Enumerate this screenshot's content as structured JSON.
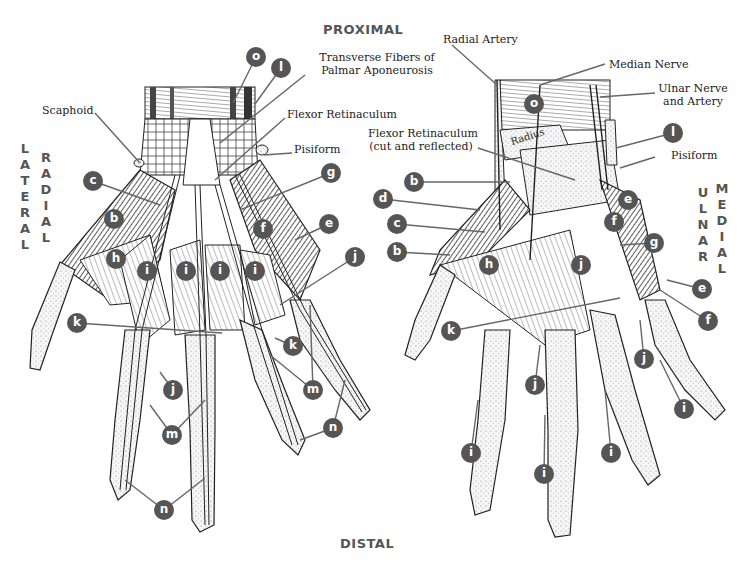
{
  "orientation": {
    "top": "PROXIMAL",
    "bottom": "DISTAL",
    "left_outer": "LATERAL",
    "left_inner": "RADIAL",
    "right_inner": "ULNAR",
    "right_outer": "MEDIAL"
  },
  "colors": {
    "badge": "#555555",
    "badge_text": "#ffffff",
    "leader": "#666666",
    "orientation_text": "#555555",
    "muscle_dark": "#3a3a3a",
    "bone": "#f4f4f4"
  },
  "left_view": {
    "text_labels": [
      {
        "id": "scaphoid",
        "text": "Scaphoid"
      },
      {
        "id": "transverse_fibers",
        "line1": "Transverse Fibers of",
        "line2": "Palmar Aponeurosis"
      },
      {
        "id": "flexor_retinaculum",
        "text": "Flexor Retinaculum"
      },
      {
        "id": "pisiform",
        "text": "Pisiform"
      }
    ],
    "badges": [
      {
        "letter": "o",
        "x": 256,
        "y": 57
      },
      {
        "letter": "l",
        "x": 281,
        "y": 68
      },
      {
        "letter": "c",
        "x": 93,
        "y": 181
      },
      {
        "letter": "g",
        "x": 331,
        "y": 173
      },
      {
        "letter": "b",
        "x": 114,
        "y": 219
      },
      {
        "letter": "e",
        "x": 329,
        "y": 224
      },
      {
        "letter": "f",
        "x": 263,
        "y": 229
      },
      {
        "letter": "h",
        "x": 116,
        "y": 259
      },
      {
        "letter": "i",
        "x": 147,
        "y": 271
      },
      {
        "letter": "i",
        "x": 186,
        "y": 271
      },
      {
        "letter": "i",
        "x": 220,
        "y": 271
      },
      {
        "letter": "i",
        "x": 255,
        "y": 271
      },
      {
        "letter": "j",
        "x": 355,
        "y": 257
      },
      {
        "letter": "k",
        "x": 77,
        "y": 323
      },
      {
        "letter": "k",
        "x": 293,
        "y": 346
      },
      {
        "letter": "j",
        "x": 173,
        "y": 390
      },
      {
        "letter": "m",
        "x": 313,
        "y": 390
      },
      {
        "letter": "m",
        "x": 172,
        "y": 435
      },
      {
        "letter": "n",
        "x": 333,
        "y": 428
      },
      {
        "letter": "n",
        "x": 164,
        "y": 510
      }
    ]
  },
  "right_view": {
    "text_labels": [
      {
        "id": "radial_artery",
        "text": "Radial Artery"
      },
      {
        "id": "median_nerve",
        "text": "Median Nerve"
      },
      {
        "id": "ulnar_nerve_artery",
        "line1": "Ulnar Nerve",
        "line2": "and Artery"
      },
      {
        "id": "flexor_retinaculum_cut",
        "line1": "Flexor Retinaculum",
        "line2": "(cut and reflected)"
      },
      {
        "id": "pisiform",
        "text": "Pisiform"
      },
      {
        "id": "radius",
        "text": "Radius"
      }
    ],
    "badges": [
      {
        "letter": "o",
        "x": 534,
        "y": 104
      },
      {
        "letter": "l",
        "x": 673,
        "y": 133
      },
      {
        "letter": "b",
        "x": 414,
        "y": 182
      },
      {
        "letter": "d",
        "x": 383,
        "y": 199
      },
      {
        "letter": "e",
        "x": 628,
        "y": 200
      },
      {
        "letter": "c",
        "x": 397,
        "y": 224
      },
      {
        "letter": "f",
        "x": 614,
        "y": 222
      },
      {
        "letter": "g",
        "x": 654,
        "y": 243
      },
      {
        "letter": "b",
        "x": 397,
        "y": 252
      },
      {
        "letter": "h",
        "x": 489,
        "y": 265
      },
      {
        "letter": "j",
        "x": 581,
        "y": 265
      },
      {
        "letter": "e",
        "x": 702,
        "y": 289
      },
      {
        "letter": "f",
        "x": 708,
        "y": 321
      },
      {
        "letter": "k",
        "x": 451,
        "y": 331
      },
      {
        "letter": "j",
        "x": 644,
        "y": 359
      },
      {
        "letter": "j",
        "x": 535,
        "y": 385
      },
      {
        "letter": "i",
        "x": 684,
        "y": 409
      },
      {
        "letter": "i",
        "x": 471,
        "y": 453
      },
      {
        "letter": "i",
        "x": 611,
        "y": 453
      },
      {
        "letter": "i",
        "x": 544,
        "y": 474
      }
    ]
  }
}
